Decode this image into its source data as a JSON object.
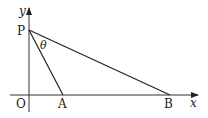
{
  "diagram": {
    "type": "geometry-coordinate-figure",
    "axes": {
      "x_label": "x",
      "y_label": "y",
      "origin_label": "O"
    },
    "points": [
      {
        "name": "P",
        "label": "P",
        "x": 29,
        "y": 30,
        "on": "y-axis"
      },
      {
        "name": "A",
        "label": "A",
        "x": 63,
        "y": 95,
        "on": "x-axis"
      },
      {
        "name": "B",
        "label": "B",
        "x": 170,
        "y": 95,
        "on": "x-axis"
      }
    ],
    "segments": [
      "PA",
      "PB"
    ],
    "angle": {
      "label": "θ",
      "between": [
        "PA",
        "PB"
      ],
      "vertex": "P"
    },
    "colors": {
      "stroke": "#222222",
      "background": "#ffffff"
    }
  }
}
